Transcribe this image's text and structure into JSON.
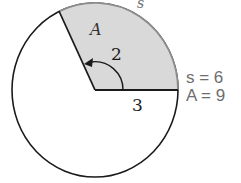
{
  "diagram": {
    "type": "circle-sector",
    "colors": {
      "sector_fill": "#d9d9d9",
      "stroke": "#1a1a1a",
      "arc_stroke": "#8c8c8c",
      "result_text": "#6e6e6e"
    },
    "labels": {
      "area_label": "A",
      "arc_label": "s",
      "angle_label": "2",
      "radius_label": "3"
    },
    "results": {
      "s_line": "s = 6",
      "a_line": "A = 9"
    },
    "values": {
      "radius": 3,
      "angle_radians": 2,
      "arc_length": 6,
      "area": 9
    }
  }
}
